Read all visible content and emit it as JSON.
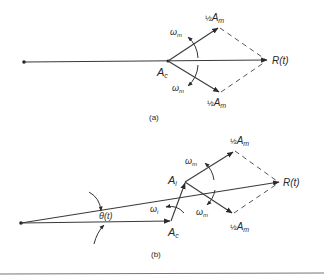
{
  "figure": {
    "part_a": {
      "caption": "(a)",
      "labels": {
        "carrier": "A",
        "carrier_sub": "c",
        "resultant": "R(t)",
        "upper_sideband_frac": "½",
        "upper_sideband": "A",
        "upper_sideband_sub": "m",
        "lower_sideband_frac": "½",
        "lower_sideband": "A",
        "lower_sideband_sub": "m",
        "omega_upper": "ω",
        "omega_upper_sub": "m",
        "omega_lower": "ω",
        "omega_lower_sub": "m"
      }
    },
    "part_b": {
      "caption": "(b)",
      "labels": {
        "carrier": "A",
        "carrier_sub": "c",
        "interferer": "A",
        "interferer_sub": "i",
        "resultant": "R(t)",
        "phase_angle": "θ(t)",
        "upper_sideband_frac": "½",
        "upper_sideband": "A",
        "upper_sideband_sub": "m",
        "lower_sideband_frac": "½",
        "lower_sideband": "A",
        "lower_sideband_sub": "m",
        "omega_interferer": "ω",
        "omega_interferer_sub": "i",
        "omega_upper": "ω",
        "omega_upper_sub": "m",
        "omega_lower": "ω",
        "omega_lower_sub": "m"
      }
    }
  }
}
